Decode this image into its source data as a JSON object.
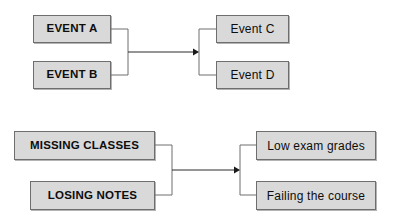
{
  "canvas": {
    "width": 397,
    "height": 224,
    "background": "#ffffff"
  },
  "style": {
    "box_fill": "#d9d9d9",
    "box_border": "#6e6e6e",
    "connector_color": "#6f6f6f",
    "arrow_color": "#1a1a1a",
    "text_color": "#0d0d0d"
  },
  "diagrams": [
    {
      "id": "event-diagram",
      "causes": [
        {
          "label": "EVENT A"
        },
        {
          "label": "EVENT B"
        }
      ],
      "effects": [
        {
          "label": "Event C"
        },
        {
          "label": "Event D"
        }
      ]
    },
    {
      "id": "study-diagram",
      "causes": [
        {
          "label": "MISSING CLASSES"
        },
        {
          "label": "LOSING NOTES"
        }
      ],
      "effects": [
        {
          "label": "Low exam grades"
        },
        {
          "label": "Failing the course"
        }
      ]
    }
  ],
  "icons": {
    "arrow": "arrow-right-icon"
  }
}
